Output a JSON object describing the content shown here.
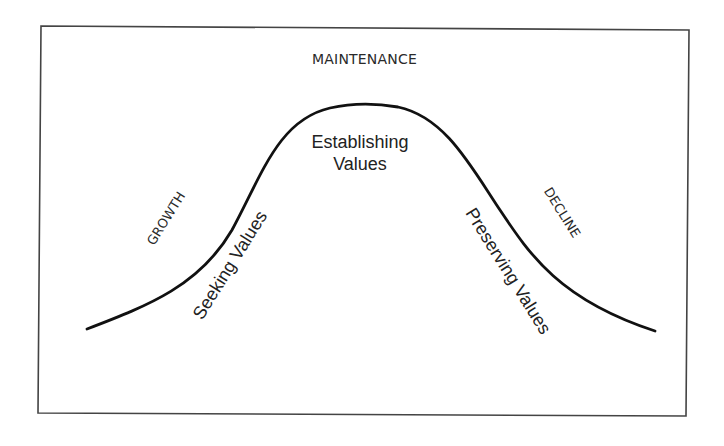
{
  "diagram": {
    "type": "bell-curve-lifecycle",
    "colors": {
      "background": "#ffffff",
      "frame": "#444444",
      "curve": "#111111",
      "text": "#222222"
    },
    "top_label": "MAINTENANCE",
    "stages": {
      "left": "GROWTH",
      "right": "DECLINE"
    },
    "phases": {
      "rising": "Seeking Values",
      "peak_line1": "Establishing",
      "peak_line2": "Values",
      "falling": "Preserving Values"
    }
  }
}
